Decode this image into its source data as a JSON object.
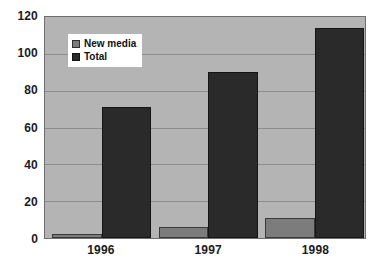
{
  "chart_data": {
    "type": "bar",
    "title": "",
    "subtitle": "",
    "xlabel": "",
    "ylabel": "",
    "categories": [
      "1996",
      "1997",
      "1998"
    ],
    "series": [
      {
        "name": "New media",
        "values": [
          2,
          6,
          11
        ],
        "color": "#7c7c7c"
      },
      {
        "name": "Total",
        "values": [
          71,
          90,
          114
        ],
        "color": "#2a2a2a"
      }
    ],
    "ylim": [
      0,
      120
    ],
    "yticks": [
      0,
      20,
      40,
      60,
      80,
      100,
      120
    ],
    "ytick_labels": [
      "0",
      "20",
      "40",
      "60",
      "80",
      "100",
      "120"
    ],
    "grid": true,
    "grid_axis": "y",
    "legend_position": "upper-left",
    "plot_background": "#b4b4b4",
    "figure_background": "#ffffff",
    "grid_color": "#8d8d8d",
    "axis_color": "#6f6f6f",
    "text_color": "#1b1b1b"
  },
  "legend": {
    "items": [
      {
        "label": "New media",
        "swatch": "legend-swatch-new-media"
      },
      {
        "label": "Total",
        "swatch": "legend-swatch-total"
      }
    ]
  },
  "axes": {
    "y_tick_labels": [
      "120",
      "100",
      "80",
      "60",
      "40",
      "20",
      "0"
    ],
    "x_tick_labels": [
      "1996",
      "1997",
      "1998"
    ]
  }
}
